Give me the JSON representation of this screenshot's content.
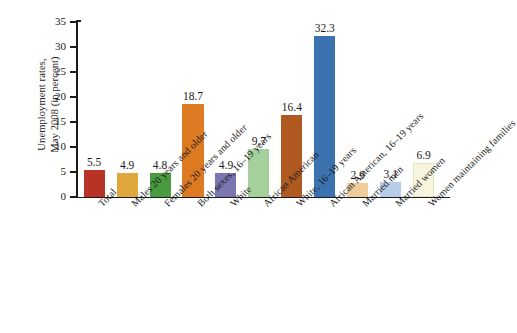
{
  "chart_data": {
    "type": "bar",
    "title": "",
    "xlabel": "",
    "ylabel": "Unemployment rates, May 2008 (in percent)",
    "ylabel_line1": "Unemployment rates,",
    "ylabel_line2": "May 2008 (in percent)",
    "ylim": [
      0,
      35
    ],
    "ytick_step": 5,
    "yticks": [
      "0",
      "5",
      "10",
      "15",
      "20",
      "25",
      "30",
      "35"
    ],
    "grid": false,
    "legend": "none",
    "categories": [
      "Total",
      "Males 20 years and older",
      "Females 20 years and older",
      "Both sexes, 16–19 years",
      "White",
      "African American",
      "White, 16–19 years",
      "African American, 16–19 years",
      "Married men",
      "Married women",
      "Women maintaining families"
    ],
    "values": [
      5.5,
      4.9,
      4.8,
      18.7,
      4.9,
      9.7,
      16.4,
      32.3,
      2.9,
      3.1,
      6.9
    ],
    "value_labels": [
      "5.5",
      "4.9",
      "4.8",
      "18.7",
      "4.9",
      "9.7",
      "16.4",
      "32.3",
      "2.9",
      "3.1",
      "6.9"
    ],
    "bar_colors": [
      "#B93226",
      "#E0A83C",
      "#4A9A3F",
      "#DD7A22",
      "#7B75B0",
      "#A5D09B",
      "#B05A22",
      "#3B73B0",
      "#EFCD9A",
      "#B8CBE8",
      "#F7F5DE"
    ],
    "axis_color": "#1a1a1a",
    "background_color": "#ffffff"
  }
}
